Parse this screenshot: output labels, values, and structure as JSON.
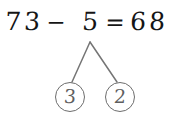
{
  "canvas": {
    "width": 174,
    "height": 116,
    "background_color": "#ffffff",
    "description": "Handwritten subtraction equation with a number bond decomposition tree"
  },
  "equation": {
    "full_text": "73 - 5 = 68",
    "minuend": "73",
    "minuend_tens_digit": "7",
    "minuend_ones_digit": "3",
    "operator": "−",
    "subtrahend": "5",
    "equals": "=",
    "result": "68",
    "result_tens_digit": "6",
    "result_ones_digit": "8",
    "ink_color": "#151515"
  },
  "number_bond": {
    "parent_value": "5",
    "parent_source": "subtrahend",
    "line_color": "#757575",
    "circle_color": "#6d6d6d",
    "digit_color": "#5f5f5f",
    "nodes": [
      {
        "label": "3",
        "position": "left"
      },
      {
        "label": "2",
        "position": "right"
      }
    ]
  }
}
